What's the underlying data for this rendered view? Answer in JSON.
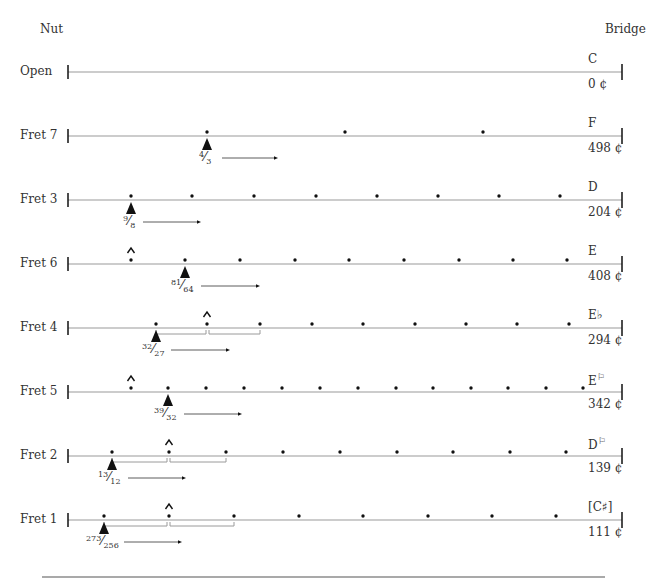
{
  "header": {
    "nut_label": "Nut",
    "bridge_label": "Bridge"
  },
  "geometry": {
    "nut_x": 68,
    "bridge_x": 622,
    "row_y0": 72,
    "row_spacing": 64,
    "footer_line": {
      "x1": 42,
      "x2": 605,
      "y": 577
    }
  },
  "rows": [
    {
      "label": "Open",
      "note": "C",
      "cents": "0 ¢",
      "dots": [],
      "marker_x": null,
      "ratio": null,
      "harmonic_x": null,
      "brackets": []
    },
    {
      "label": "Fret 7",
      "note": "F",
      "cents": "498 ¢",
      "dots": [
        207,
        345,
        483
      ],
      "marker_x": 207,
      "ratio": {
        "num": "4",
        "den": "3"
      },
      "arrow": [
        222,
        275
      ],
      "harmonic_x": null,
      "brackets": []
    },
    {
      "label": "Fret 3",
      "note": "D",
      "cents": "204 ¢",
      "dots": [
        131,
        192,
        254,
        316,
        377,
        438,
        499,
        560
      ],
      "marker_x": 131,
      "ratio": {
        "num": "9",
        "den": "8"
      },
      "arrow": [
        143,
        198
      ],
      "harmonic_x": null,
      "brackets": []
    },
    {
      "label": "Fret 6",
      "note": "E",
      "cents": "408 ¢",
      "dots": [
        131,
        185,
        240,
        295,
        349,
        404,
        459,
        513,
        567
      ],
      "marker_x": 185,
      "ratio": {
        "num": "81",
        "den": "64"
      },
      "arrow": [
        201,
        257
      ],
      "harmonic_x": 131,
      "brackets": []
    },
    {
      "label": "Fret 4",
      "note": "E♭",
      "cents": "294 ¢",
      "dots": [
        156,
        207,
        260,
        312,
        363,
        415,
        466,
        517,
        569
      ],
      "marker_x": 156,
      "ratio": {
        "num": "32",
        "den": "27"
      },
      "arrow": [
        171,
        227
      ],
      "harmonic_x": 207,
      "brackets": [
        [
          156,
          206
        ],
        [
          209,
          260
        ]
      ]
    },
    {
      "label": "Fret 5",
      "note": "E",
      "note_accidental": "⚐",
      "cents": "342 ¢",
      "dots": [
        131,
        168,
        206,
        244,
        282,
        320,
        358,
        396,
        433,
        471,
        508,
        546,
        583
      ],
      "marker_x": 168,
      "ratio": {
        "num": "39",
        "den": "32"
      },
      "arrow": [
        184,
        239
      ],
      "harmonic_x": 131,
      "brackets": []
    },
    {
      "label": "Fret 2",
      "note": "D",
      "note_accidental": "⚐",
      "cents": "139 ¢",
      "dots": [
        112,
        169,
        226,
        283,
        340,
        397,
        453,
        510,
        566
      ],
      "marker_x": 112,
      "ratio": {
        "num": "13",
        "den": "12"
      },
      "arrow": [
        128,
        183
      ],
      "harmonic_x": 169,
      "brackets": [
        [
          112,
          167
        ],
        [
          170,
          226
        ]
      ]
    },
    {
      "label": "Fret 1",
      "note": "[C♯]",
      "cents": "111 ¢",
      "dots": [
        104,
        169,
        234,
        299,
        363,
        428,
        492,
        556
      ],
      "marker_x": 104,
      "ratio": {
        "num": "273",
        "den": "256"
      },
      "arrow": [
        124,
        179
      ],
      "harmonic_x": 169,
      "brackets": [
        [
          104,
          167
        ],
        [
          170,
          234
        ]
      ]
    }
  ],
  "colors": {
    "string": "#9a9a9a",
    "ink": "#111111",
    "text": "#333333"
  }
}
